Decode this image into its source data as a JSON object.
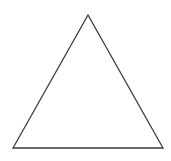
{
  "diagram": {
    "shape": "triangle",
    "vertices": [
      [
        88,
        15
      ],
      [
        13,
        148
      ],
      [
        163,
        148
      ]
    ],
    "stroke_color": "#3a3a3a",
    "fill_color": "#ffffff",
    "stroke_width": 1.3
  }
}
